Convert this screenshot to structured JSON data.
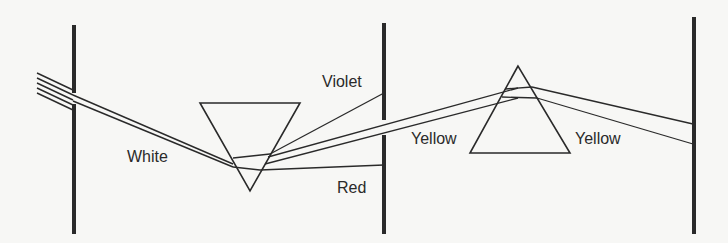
{
  "diagram": {
    "title": "",
    "stroke_color": "#2a2a2a",
    "background": "#f7f7f5",
    "labels": {
      "white": "White",
      "violet": "Violet",
      "red": "Red",
      "yellow_left": "Yellow",
      "yellow_right": "Yellow"
    },
    "components": [
      {
        "name": "Screen with slit",
        "type": "screen"
      },
      {
        "name": "Prism 1 (inverted)",
        "type": "prism"
      },
      {
        "name": "Screen with slit",
        "type": "screen"
      },
      {
        "name": "Prism 2",
        "type": "prism"
      },
      {
        "name": "Final screen",
        "type": "screen"
      }
    ]
  }
}
